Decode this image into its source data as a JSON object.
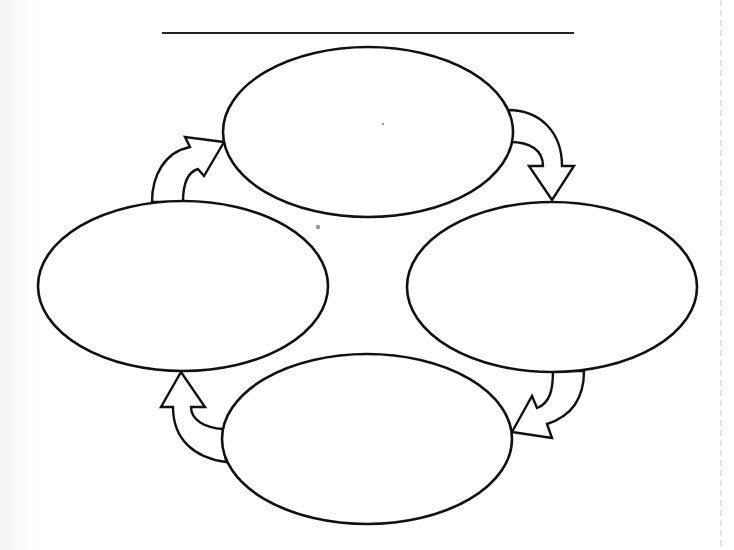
{
  "diagram": {
    "type": "cycle",
    "title": "",
    "title_line": {
      "x1": 162,
      "x2": 574,
      "y": 33
    },
    "node_stroke": "#111111",
    "background": "#ffffff",
    "nodes": [
      {
        "id": "top",
        "label": "",
        "cx": 368,
        "cy": 132,
        "rx": 145,
        "ry": 85
      },
      {
        "id": "right",
        "label": "",
        "cx": 552,
        "cy": 287,
        "rx": 145,
        "ry": 85
      },
      {
        "id": "bottom",
        "label": "",
        "cx": 367,
        "cy": 439,
        "rx": 145,
        "ry": 85
      },
      {
        "id": "left",
        "label": "",
        "cx": 183,
        "cy": 286,
        "rx": 145,
        "ry": 85
      }
    ],
    "edges": [
      {
        "from": "top",
        "to": "right",
        "direction": "clockwise"
      },
      {
        "from": "right",
        "to": "bottom",
        "direction": "clockwise"
      },
      {
        "from": "bottom",
        "to": "left",
        "direction": "clockwise"
      },
      {
        "from": "left",
        "to": "top",
        "direction": "clockwise"
      }
    ]
  }
}
